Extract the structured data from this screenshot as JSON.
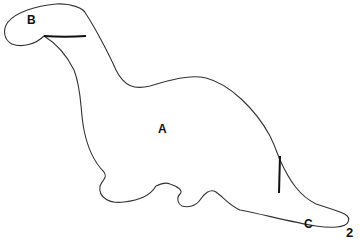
{
  "figure": {
    "number": "2",
    "regions": [
      {
        "id": "A",
        "label": "A",
        "description": "body"
      },
      {
        "id": "B",
        "label": "B",
        "description": "head"
      },
      {
        "id": "C",
        "label": "C",
        "description": "tail tip"
      }
    ],
    "colors": {
      "outline": "#333333",
      "divider": "#111111",
      "background": "#ffffff"
    }
  }
}
